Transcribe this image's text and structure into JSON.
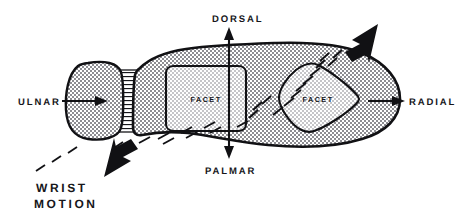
{
  "figure": {
    "type": "anatomical-diagram",
    "background_color": "#ffffff",
    "ink_color": "#111114"
  },
  "labels": {
    "dorsal": "DORSAL",
    "palmar": "PALMAR",
    "ulnar": "ULNAR",
    "radial": "RADIAL",
    "facet_left": "FACET",
    "facet_right": "FACET",
    "wrist": "WRIST",
    "motion": "MOTION"
  },
  "annotations": {
    "direction_arrows": [
      {
        "name": "dorsal-arrow",
        "direction": "up",
        "label": "DORSAL"
      },
      {
        "name": "palmar-arrow",
        "direction": "down",
        "label": "PALMAR"
      },
      {
        "name": "ulnar-arrow",
        "direction": "right",
        "label": "ULNAR"
      },
      {
        "name": "radial-arrow",
        "direction": "right",
        "label": "RADIAL"
      }
    ],
    "motion_arrows": [
      {
        "name": "wrist-motion-arrow-distal",
        "direction": "up-right",
        "style": "bold-solid"
      },
      {
        "name": "wrist-motion-arrow-proximal",
        "direction": "down-left",
        "style": "bold-solid"
      }
    ],
    "motion_path_style": "dashed",
    "fill_patterns": {
      "body": "dark-stipple",
      "facet": "light-stipple",
      "ligament": "horizontal-hatch"
    }
  },
  "shapes": {
    "proximal_bone": "rounded-bone-left",
    "ligament_band": "hatched-connector",
    "main_bone": "elongated-carpal-body",
    "facet_left_shape": "rounded-rectangle",
    "facet_right_shape": "triangular-teardrop"
  }
}
